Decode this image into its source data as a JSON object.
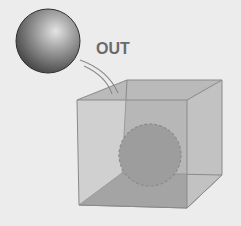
{
  "diagram": {
    "label": "OUT",
    "colors": {
      "background": "#ececec",
      "cube_face": "#b4b4b4",
      "cube_floor": "#9a9a9a",
      "cube_edge": "#8a8a8a",
      "ball_dark": "#3a3a3a",
      "ball_light": "#d8d8d8",
      "inner_sphere": "#8e8e8e",
      "label": "#6a6a6a"
    },
    "elements": [
      "outside-ball",
      "motion-arcs",
      "transparent-cube",
      "inner-sphere-dashed"
    ]
  }
}
